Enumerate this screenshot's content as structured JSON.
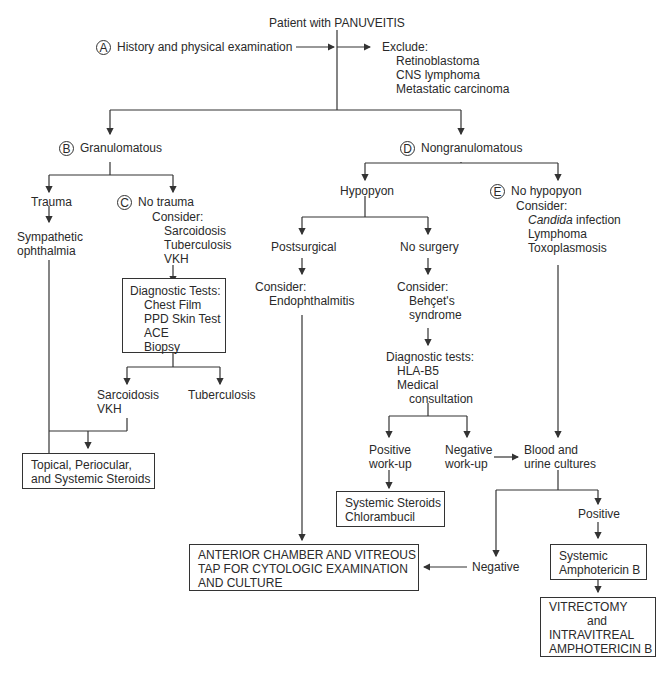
{
  "title": "Patient with PANUVEITIS",
  "stepA": {
    "marker": "A",
    "label": "History and physical examination"
  },
  "exclude": {
    "heading": "Exclude:",
    "items": [
      "Retinoblastoma",
      "CNS lymphoma",
      "Metastatic carcinoma"
    ]
  },
  "stepB": {
    "marker": "B",
    "label": "Granulomatous"
  },
  "stepD": {
    "marker": "D",
    "label": "Nongranulomatous"
  },
  "trauma": {
    "label": "Trauma",
    "result": [
      "Sympathetic",
      "ophthalmia"
    ]
  },
  "stepC": {
    "marker": "C",
    "label": "No trauma",
    "consider": "Consider:",
    "items": [
      "Sarcoidosis",
      "Tuberculosis",
      "VKH"
    ]
  },
  "diagTests": {
    "heading": "Diagnostic Tests:",
    "items": [
      "Chest Film",
      "PPD Skin Test",
      "ACE",
      "Biopsy"
    ]
  },
  "sarcVkh": [
    "Sarcoidosis",
    "VKH"
  ],
  "tuberculosis": "Tuberculosis",
  "steroidsBox": [
    "Topical, Periocular,",
    "and Systemic Steroids"
  ],
  "hypopyon": "Hypopyon",
  "postsurgical": {
    "label": "Postsurgical",
    "consider": "Consider:",
    "item": "Endophthalmitis"
  },
  "noSurgery": {
    "label": "No surgery",
    "consider": "Consider:",
    "items": [
      "Behçet's",
      "syndrome"
    ]
  },
  "diagTests2": {
    "heading": "Diagnostic tests:",
    "items": [
      "HLA-B5",
      "Medical"
    ],
    "tail": "consultation"
  },
  "positiveWorkup": [
    "Positive",
    "work-up"
  ],
  "negativeWorkup": [
    "Negative",
    "work-up"
  ],
  "stepE": {
    "marker": "E",
    "label": "No hypopyon",
    "consider": "Consider:",
    "italic": "Candida",
    "items_rest": " infection",
    "items": [
      "Lymphoma",
      "Toxoplasmosis"
    ]
  },
  "bloodUrine": [
    "Blood and",
    "urine cultures"
  ],
  "systemicChlor": [
    "Systemic Steroids",
    "Chlorambucil"
  ],
  "positive": "Positive",
  "negative": "Negative",
  "amphoBox": [
    "Systemic",
    "Amphotericin B"
  ],
  "anteriorBox": [
    "ANTERIOR CHAMBER AND VITREOUS",
    "TAP FOR CYTOLOGIC EXAMINATION",
    "AND CULTURE"
  ],
  "vitrectomyBox": [
    "VITRECTOMY",
    "and",
    "INTRAVITREAL",
    "AMPHOTERICIN B"
  ]
}
